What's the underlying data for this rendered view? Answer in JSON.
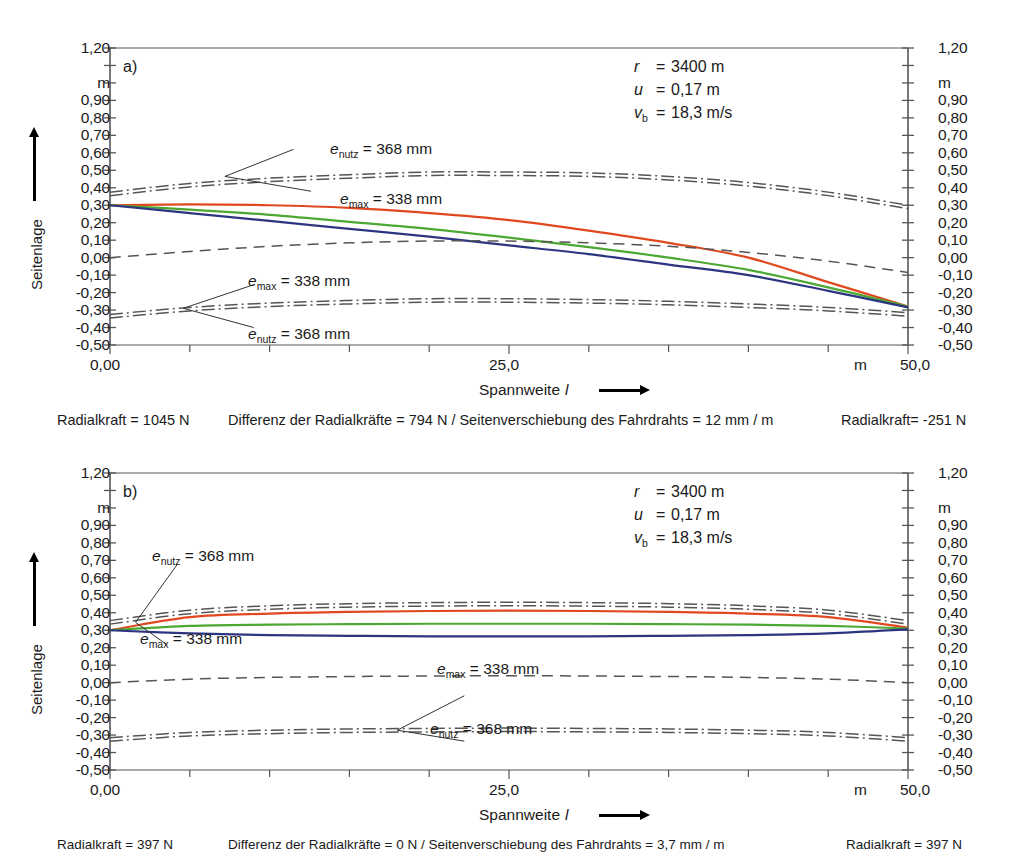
{
  "figure": {
    "axis": {
      "y_title": "Seitenlage",
      "y_unit": "m",
      "y_ticks": [
        "1,20",
        "0,90",
        "0,80",
        "0,70",
        "0,60",
        "0,50",
        "0,40",
        "0,30",
        "0,20",
        "0,10",
        "0,00",
        "-0,10",
        "-0,20",
        "-0,30",
        "-0,40",
        "-0,50"
      ],
      "y_min": -0.5,
      "y_max": 1.2,
      "x_title": "Spannweite",
      "x_symbol": "l",
      "x_unit": "m",
      "x_ticks": [
        "0,00",
        "25,0",
        "50,0"
      ],
      "x_min": 0,
      "x_max": 50
    },
    "colors": {
      "curve_red": "#E0491F",
      "curve_green": "#4CA832",
      "curve_blue": "#2C3580",
      "envelope": "#555555",
      "axis": "#555555"
    },
    "panels": [
      {
        "id": "a",
        "letter": "a)",
        "params": [
          {
            "symbol": "r",
            "sub": "",
            "eq": "=",
            "value": "3400 m"
          },
          {
            "symbol": "u",
            "sub": "",
            "eq": "=",
            "value": "0,17 m"
          },
          {
            "symbol": "v",
            "sub": "b",
            "eq": "=",
            "value": "18,3 m/s"
          }
        ],
        "annotations": [
          {
            "name": "e",
            "sub": "nutz",
            "value": "= 368 mm",
            "group": "upper-top"
          },
          {
            "name": "e",
            "sub": "max",
            "value": "= 338 mm",
            "group": "upper-bottom"
          },
          {
            "name": "e",
            "sub": "max",
            "value": "= 338 mm",
            "group": "lower-top"
          },
          {
            "name": "e",
            "sub": "nutz",
            "value": "= 368 mm",
            "group": "lower-bottom"
          }
        ],
        "caption_left": "Radialkraft = 1045 N",
        "caption_center": "Differenz der Radialkräfte = 794 N / Seitenverschiebung des Fahrdrahts = 12 mm / m",
        "caption_right": "Radialkraft= -251 N"
      },
      {
        "id": "b",
        "letter": "b)",
        "params": [
          {
            "symbol": "r",
            "sub": "",
            "eq": "=",
            "value": "3400 m"
          },
          {
            "symbol": "u",
            "sub": "",
            "eq": "=",
            "value": "0,17 m"
          },
          {
            "symbol": "v",
            "sub": "b",
            "eq": "=",
            "value": "18,3 m/s"
          }
        ],
        "annotations": [
          {
            "name": "e",
            "sub": "nutz",
            "value": "= 368 mm",
            "group": "upper-top"
          },
          {
            "name": "e",
            "sub": "max",
            "value": "= 338 mm",
            "group": "upper-bottom"
          },
          {
            "name": "e",
            "sub": "max",
            "value": "= 338 mm",
            "group": "lower-top"
          },
          {
            "name": "e",
            "sub": "nutz",
            "value": "= 368 mm",
            "group": "lower-bottom"
          }
        ],
        "caption_left": "Radialkraft = 397 N",
        "caption_center": "Differenz der Radialkräfte = 0 N / Seitenverschiebung des Fahrdrahts = 3,7 mm / m",
        "caption_right": "Radialkraft = 397 N"
      }
    ]
  },
  "chart_data": [
    {
      "type": "line",
      "title": "a)",
      "xlabel": "Spannweite l (m)",
      "ylabel": "Seitenlage (m)",
      "xlim": [
        0,
        50
      ],
      "ylim": [
        -0.5,
        1.2
      ],
      "grid": false,
      "legend": "none",
      "x": [
        0,
        5,
        10,
        15,
        20,
        25,
        30,
        35,
        40,
        45,
        50
      ],
      "series": [
        {
          "name": "curve-red",
          "color": "#E0491F",
          "style": "solid",
          "values": [
            0.3,
            0.305,
            0.3,
            0.285,
            0.255,
            0.215,
            0.155,
            0.085,
            0.0,
            -0.14,
            -0.28
          ]
        },
        {
          "name": "curve-green",
          "color": "#4CA832",
          "style": "solid",
          "values": [
            0.3,
            0.275,
            0.245,
            0.205,
            0.165,
            0.115,
            0.06,
            0.0,
            -0.07,
            -0.17,
            -0.28
          ]
        },
        {
          "name": "curve-blue",
          "color": "#2C3580",
          "style": "solid",
          "values": [
            0.3,
            0.255,
            0.21,
            0.165,
            0.12,
            0.07,
            0.02,
            -0.04,
            -0.1,
            -0.19,
            -0.285
          ]
        },
        {
          "name": "envelope-e-nutz-upper",
          "color": "#555555",
          "style": "dash-dot",
          "values": [
            0.375,
            0.425,
            0.455,
            0.475,
            0.49,
            0.49,
            0.485,
            0.465,
            0.43,
            0.375,
            0.3
          ]
        },
        {
          "name": "envelope-e-max-upper",
          "color": "#555555",
          "style": "dash-dot",
          "values": [
            0.355,
            0.405,
            0.435,
            0.455,
            0.47,
            0.47,
            0.465,
            0.445,
            0.41,
            0.355,
            0.28
          ]
        },
        {
          "name": "envelope-mid-dashed",
          "color": "#555555",
          "style": "dashed",
          "values": [
            0.0,
            0.035,
            0.065,
            0.085,
            0.095,
            0.095,
            0.085,
            0.065,
            0.03,
            -0.02,
            -0.085
          ]
        },
        {
          "name": "envelope-e-max-lower",
          "color": "#555555",
          "style": "dash-dot",
          "values": [
            -0.325,
            -0.285,
            -0.26,
            -0.245,
            -0.235,
            -0.235,
            -0.24,
            -0.25,
            -0.265,
            -0.285,
            -0.315
          ]
        },
        {
          "name": "envelope-e-nutz-lower",
          "color": "#555555",
          "style": "dash-dot",
          "values": [
            -0.345,
            -0.305,
            -0.28,
            -0.265,
            -0.255,
            -0.255,
            -0.26,
            -0.27,
            -0.285,
            -0.305,
            -0.335
          ]
        }
      ],
      "annotations": [
        {
          "text": "e_nutz = 368 mm",
          "x": 11,
          "y": 0.62
        },
        {
          "text": "e_max = 338 mm",
          "x": 13,
          "y": 0.37
        },
        {
          "text": "e_max = 338 mm",
          "x": 7,
          "y": -0.17
        },
        {
          "text": "e_nutz = 368 mm",
          "x": 8,
          "y": -0.4
        }
      ]
    },
    {
      "type": "line",
      "title": "b)",
      "xlabel": "Spannweite l (m)",
      "ylabel": "Seitenlage (m)",
      "xlim": [
        0,
        50
      ],
      "ylim": [
        -0.5,
        1.2
      ],
      "grid": false,
      "legend": "none",
      "x": [
        0,
        5,
        10,
        15,
        20,
        25,
        30,
        35,
        40,
        45,
        50
      ],
      "series": [
        {
          "name": "curve-red",
          "color": "#E0491F",
          "style": "solid",
          "values": [
            0.3,
            0.375,
            0.395,
            0.405,
            0.41,
            0.412,
            0.41,
            0.405,
            0.395,
            0.375,
            0.315
          ]
        },
        {
          "name": "curve-green",
          "color": "#4CA832",
          "style": "solid",
          "values": [
            0.3,
            0.325,
            0.332,
            0.335,
            0.337,
            0.337,
            0.337,
            0.335,
            0.332,
            0.325,
            0.31
          ]
        },
        {
          "name": "curve-blue",
          "color": "#2C3580",
          "style": "solid",
          "values": [
            0.3,
            0.282,
            0.272,
            0.268,
            0.265,
            0.265,
            0.265,
            0.268,
            0.272,
            0.282,
            0.305
          ]
        },
        {
          "name": "envelope-e-nutz-upper",
          "color": "#555555",
          "style": "dash-dot",
          "values": [
            0.355,
            0.415,
            0.44,
            0.452,
            0.458,
            0.46,
            0.458,
            0.452,
            0.44,
            0.415,
            0.355
          ]
        },
        {
          "name": "envelope-e-max-upper",
          "color": "#555555",
          "style": "dash-dot",
          "values": [
            0.335,
            0.395,
            0.42,
            0.432,
            0.438,
            0.44,
            0.438,
            0.432,
            0.42,
            0.395,
            0.335
          ]
        },
        {
          "name": "envelope-mid-dashed",
          "color": "#555555",
          "style": "dashed",
          "values": [
            0.0,
            0.02,
            0.03,
            0.035,
            0.038,
            0.04,
            0.038,
            0.035,
            0.03,
            0.02,
            0.0
          ]
        },
        {
          "name": "envelope-e-max-lower",
          "color": "#555555",
          "style": "dash-dot",
          "values": [
            -0.315,
            -0.285,
            -0.272,
            -0.265,
            -0.262,
            -0.26,
            -0.262,
            -0.265,
            -0.272,
            -0.285,
            -0.315
          ]
        },
        {
          "name": "envelope-e-nutz-lower",
          "color": "#555555",
          "style": "dash-dot",
          "values": [
            -0.335,
            -0.305,
            -0.292,
            -0.285,
            -0.282,
            -0.28,
            -0.282,
            -0.285,
            -0.292,
            -0.305,
            -0.335
          ]
        }
      ],
      "annotations": [
        {
          "text": "e_nutz = 368 mm",
          "x": 3.5,
          "y": 0.68
        },
        {
          "text": "e_max = 338 mm",
          "x": 3.0,
          "y": 0.21
        },
        {
          "text": "e_max = 338 mm",
          "x": 22,
          "y": -0.07
        },
        {
          "text": "e_nutz = 368 mm",
          "x": 24,
          "y": -0.33
        }
      ]
    }
  ]
}
